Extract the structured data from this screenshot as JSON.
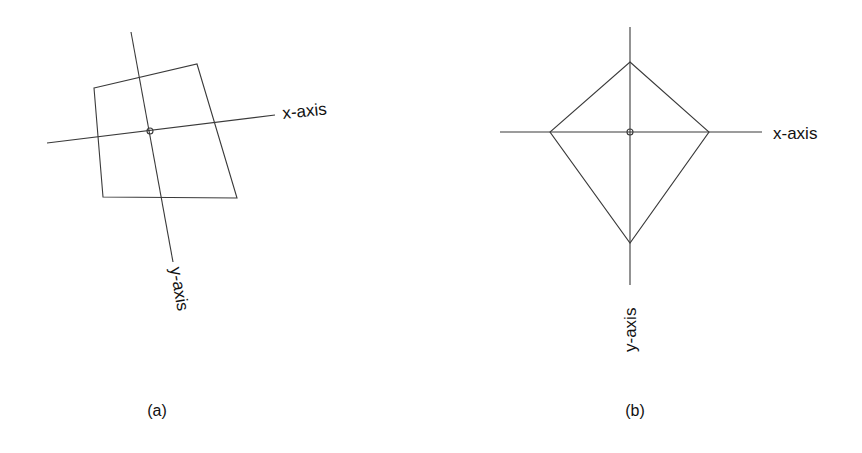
{
  "figure": {
    "panels": [
      {
        "id": "a",
        "caption": "(a)",
        "description": "Rotated coordinate axes with a quadrilateral",
        "x_axis_label": "x-axis",
        "y_axis_label": "y-axis"
      },
      {
        "id": "b",
        "caption": "(b)",
        "description": "Upright coordinate axes with a kite-shaped quadrilateral",
        "x_axis_label": "x-axis",
        "y_axis_label": "y-axis"
      }
    ]
  },
  "colors": {
    "line": "#3a3a3a",
    "text": "#111111",
    "background": "#ffffff"
  }
}
